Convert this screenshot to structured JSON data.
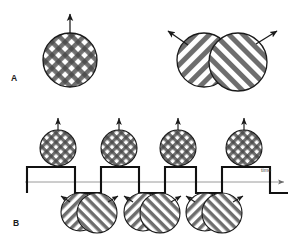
{
  "figure": {
    "background_color": "#ffffff",
    "width": 293,
    "height": 245,
    "stroke_color": "#1a1a1a",
    "grating_color": "#6e6e6e",
    "axis_color": "#9a9a9a"
  },
  "panels": [
    {
      "id": "A",
      "label": "A",
      "label_x": 11,
      "label_y": 73,
      "description": "Coherent plaid on the left moving upward; two separately-sliding component gratings on the right moving apart",
      "stimuli": [
        {
          "name": "plaid-circle",
          "kind": "plaid",
          "cx": 70,
          "cy": 60,
          "r": 27,
          "arrows": [
            {
              "name": "up-arrow",
              "direction": "up",
              "angle_deg": 90,
              "length": 30
            }
          ]
        },
        {
          "name": "component-grating-left",
          "kind": "grating",
          "orientation": "forward-slash",
          "cx": 204,
          "cy": 60,
          "r": 27,
          "arrows": [
            {
              "name": "up-left-arrow",
              "direction": "up-left",
              "angle_deg": 145,
              "length": 28
            }
          ]
        },
        {
          "name": "component-grating-right",
          "kind": "grating",
          "orientation": "back-slash",
          "cx": 238,
          "cy": 62,
          "r": 29,
          "arrows": [
            {
              "name": "up-right-arrow",
              "direction": "up-right",
              "angle_deg": 35,
              "length": 28
            }
          ]
        }
      ]
    },
    {
      "id": "B",
      "label": "B",
      "label_x": 13,
      "label_y": 218,
      "description": "Time course: perception alternates between coherent plaid (high state) and sliding component gratings (low state)",
      "axis": {
        "name": "time-axis",
        "label": "time",
        "label_x": 261,
        "label_y": 167,
        "y": 182,
        "x_start": 25,
        "x_end": 288,
        "arrowhead": true
      },
      "waveform": {
        "name": "alternation-square-wave",
        "type": "square",
        "high_y": 167,
        "low_y": 193,
        "x_start": 27,
        "x_end": 288,
        "segments": [
          {
            "state": "high",
            "x0": 27,
            "x1": 75
          },
          {
            "state": "low",
            "x0": 75,
            "x1": 101
          },
          {
            "state": "high",
            "x0": 101,
            "x1": 139
          },
          {
            "state": "low",
            "x0": 139,
            "x1": 165
          },
          {
            "state": "high",
            "x0": 165,
            "x1": 196
          },
          {
            "state": "low",
            "x0": 196,
            "x1": 222
          },
          {
            "state": "high",
            "x0": 222,
            "x1": 270
          },
          {
            "state": "low",
            "x0": 270,
            "x1": 288
          }
        ]
      },
      "top_stimuli": [
        {
          "name": "plaid-circle-b1",
          "kind": "plaid",
          "cx": 58,
          "cy": 148,
          "r": 18,
          "arrow": {
            "name": "up-arrow",
            "direction": "up",
            "length": 13
          }
        },
        {
          "name": "plaid-circle-b2",
          "kind": "plaid",
          "cx": 119,
          "cy": 148,
          "r": 18,
          "arrow": {
            "name": "up-arrow",
            "direction": "up",
            "length": 13
          }
        },
        {
          "name": "plaid-circle-b3",
          "kind": "plaid",
          "cx": 178,
          "cy": 148,
          "r": 18,
          "arrow": {
            "name": "up-arrow",
            "direction": "up",
            "length": 13
          }
        },
        {
          "name": "plaid-circle-b4",
          "kind": "plaid",
          "cx": 244,
          "cy": 148,
          "r": 18,
          "arrow": {
            "name": "up-arrow",
            "direction": "up",
            "length": 13
          }
        }
      ],
      "bottom_stimuli": [
        {
          "name": "grating-pair-b1",
          "kind": "grating-pair",
          "cx": 88,
          "cy": 212,
          "r": 19
        },
        {
          "name": "grating-pair-b2",
          "kind": "grating-pair",
          "cx": 151,
          "cy": 212,
          "r": 19
        },
        {
          "name": "grating-pair-b3",
          "kind": "grating-pair",
          "cx": 213,
          "cy": 212,
          "r": 19
        }
      ]
    }
  ]
}
